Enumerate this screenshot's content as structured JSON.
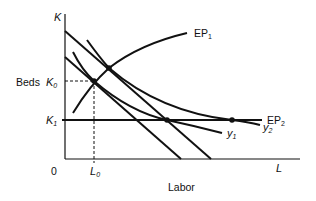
{
  "diagram": {
    "type": "economics-isoquant-expansion-path",
    "y_axis": {
      "symbol": "K",
      "title": "Beds"
    },
    "x_axis": {
      "symbol": "L",
      "title": "Labor",
      "origin": "0"
    },
    "ticks": {
      "k0": {
        "main": "K",
        "sub": "0"
      },
      "k1": {
        "main": "K",
        "sub": "1"
      },
      "l0": {
        "main": "L",
        "sub": "0"
      }
    },
    "curves": {
      "ep1": {
        "main": "EP",
        "sub": "1"
      },
      "ep2": {
        "main": "EP",
        "sub": "2"
      },
      "y1": {
        "main": "y",
        "sub": "1"
      },
      "y2": {
        "main": "y",
        "sub": "2"
      }
    },
    "colors": {
      "ink": "#111111",
      "background": "#ffffff"
    }
  }
}
